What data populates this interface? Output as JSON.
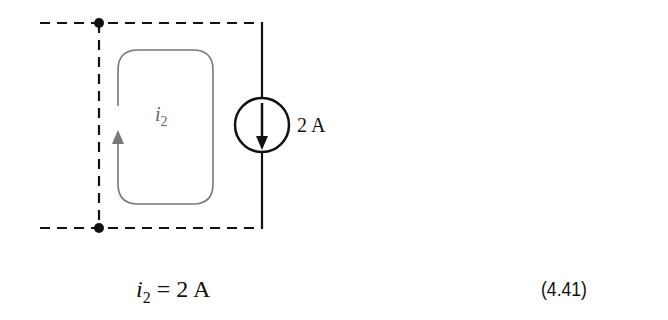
{
  "diagram": {
    "loop_label": {
      "var": "i",
      "sub": "2"
    },
    "source_label": "2 A",
    "colors": {
      "wire": "#111111",
      "loop": "#777777"
    }
  },
  "equation": {
    "var": "i",
    "sub": "2",
    "rhs": "= 2 A",
    "number": "(4.41)"
  }
}
